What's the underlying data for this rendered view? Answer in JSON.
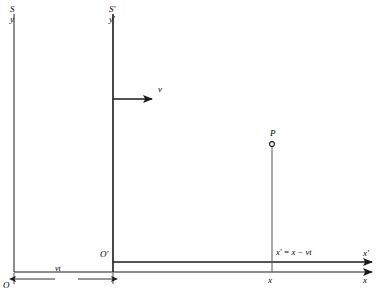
{
  "figure": {
    "width": 391,
    "height": 301,
    "background_color": "#ffffff",
    "line_color": "#1a1a1a",
    "text_color": "#000000"
  },
  "labels": {
    "frame_S": "S",
    "axis_y": "y",
    "frame_S_prime": "S′",
    "axis_y_prime": "y′",
    "velocity": "v",
    "point_P": "P",
    "origin_O": "O",
    "origin_O_prime": "O′",
    "separation": "vt",
    "equation": "x′ = x − vt",
    "x_foot": "x",
    "x_prime_end": "x′",
    "x_end": "x"
  },
  "geometry": {
    "y_axis_S": {
      "x": 14,
      "y_top": 14,
      "y_bottom": 272
    },
    "y_axis_S_prime": {
      "x": 113,
      "y_top": 14,
      "y_bottom": 272
    },
    "x_axis": {
      "y": 272,
      "x_start": 14,
      "x_end": 378
    },
    "x_axis_prime": {
      "y": 262,
      "x_start": 113,
      "x_end": 378
    },
    "velocity_arrow": {
      "y": 99,
      "x_start": 113,
      "x_end": 160
    },
    "point_P_marker": {
      "x": 272,
      "y": 144,
      "radius": 2.5
    },
    "point_P_dropline": {
      "x": 272,
      "y_top": 146,
      "y_bottom": 272
    },
    "dimension_line": {
      "y": 272,
      "x_start": 14,
      "x_end": 113,
      "offset_y": 8
    }
  },
  "elements": {
    "names": [
      "y-axis-S",
      "y-axis-S-prime",
      "x-axis",
      "x-axis-prime",
      "velocity-arrow",
      "point-P-marker",
      "point-P-dropline",
      "separation-dimension"
    ]
  }
}
